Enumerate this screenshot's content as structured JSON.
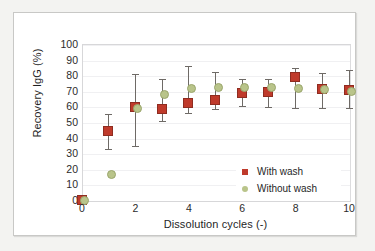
{
  "chart_data": {
    "type": "scatter",
    "title": "",
    "xlabel": "Dissolution cycles (-)",
    "ylabel": "Recovery IgG (%)",
    "xlim": [
      0,
      10
    ],
    "ylim": [
      0,
      100
    ],
    "xticks": [
      0,
      2,
      4,
      6,
      8,
      10
    ],
    "yticks": [
      0,
      10,
      20,
      30,
      40,
      50,
      60,
      70,
      80,
      90,
      100
    ],
    "grid": "horizontal",
    "legend_position": "lower-right-inside",
    "x": [
      0,
      1,
      2,
      3,
      4,
      5,
      6,
      7,
      8,
      9,
      10
    ],
    "series": [
      {
        "name": "With wash",
        "marker": "square",
        "color": "#bf3a2b",
        "values": [
          0.8,
          45,
          60.5,
          59,
          63,
          64.5,
          69,
          70,
          79.5,
          72,
          71
        ],
        "err_low": [
          0.8,
          12.5,
          26,
          8.5,
          7,
          6,
          8.5,
          10.5,
          20.5,
          13,
          12
        ],
        "err_high": [
          0.8,
          11,
          21,
          19.5,
          23.5,
          18,
          9,
          8,
          6,
          10,
          13
        ]
      },
      {
        "name": "Without wash",
        "marker": "circle",
        "color": "#b9c48a",
        "values": [
          0.5,
          16.8,
          59.5,
          68,
          72.2,
          72.5,
          73,
          72.5,
          71.8,
          71.5,
          70.5
        ],
        "err_low": [
          0,
          0,
          0,
          0,
          0,
          0,
          0,
          0,
          0,
          0,
          0
        ],
        "err_high": [
          0,
          0,
          0,
          0,
          0,
          0,
          0,
          0,
          0,
          0,
          0
        ]
      }
    ]
  },
  "axes": {
    "x_tick_labels": [
      "0",
      "2",
      "4",
      "6",
      "8",
      "10"
    ],
    "y_tick_labels": [
      "100",
      "90",
      "80",
      "70",
      "60",
      "50",
      "40",
      "30",
      "20",
      "10",
      "0"
    ],
    "x_title": "Dissolution cycles (-)",
    "y_title": "Recovery IgG (%)"
  },
  "legend": {
    "items": [
      {
        "label": "With wash",
        "marker": "square-marker-icon",
        "color": "#bf3a2b"
      },
      {
        "label": "Without wash",
        "marker": "circle-marker-icon",
        "color": "#b9c48a"
      }
    ]
  }
}
